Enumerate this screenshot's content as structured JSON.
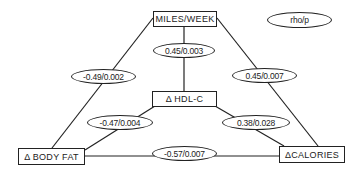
{
  "legend": {
    "label": "rho/p"
  },
  "nodes": {
    "miles_week": "MILES/WEEK",
    "hdl_c": "Δ  HDL-C",
    "body_fat": "Δ  BODY  FAT",
    "calories": "ΔCALORIES"
  },
  "edges": {
    "miles_hdl": "0.45/0.003",
    "miles_bodyfat": "-0.49/0.002",
    "miles_calories": "0.45/0.007",
    "hdl_bodyfat": "-0.47/0.004",
    "hdl_calories": "0.38/0.028",
    "bodyfat_calories": "-0.57/0.007"
  }
}
